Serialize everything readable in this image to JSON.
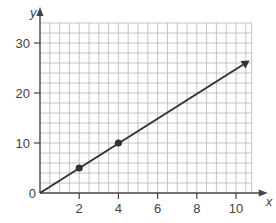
{
  "chart_data": {
    "type": "line",
    "title": "",
    "xlabel": "x",
    "ylabel": "y",
    "xlim": [
      0,
      10.8
    ],
    "ylim": [
      0,
      34
    ],
    "grid": true,
    "grid_step_x": 0.5,
    "grid_step_y": 2,
    "x_ticks": [
      2,
      4,
      6,
      8,
      10
    ],
    "y_ticks": [
      0,
      10,
      20,
      30
    ],
    "x_tick_labels": [
      "2",
      "4",
      "6",
      "8",
      "10"
    ],
    "y_tick_labels": [
      "0",
      "10",
      "20",
      "30"
    ],
    "series": [
      {
        "name": "y = 2.5x",
        "line": {
          "x": [
            0,
            10.7
          ],
          "y": [
            0,
            26.5
          ],
          "arrow_end": true
        },
        "points": [
          {
            "x": 2,
            "y": 5
          },
          {
            "x": 4,
            "y": 10
          }
        ]
      }
    ],
    "colors": {
      "line": "#333333",
      "grid": "#b5b5b5",
      "axis": "#444444"
    }
  }
}
